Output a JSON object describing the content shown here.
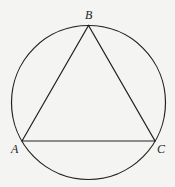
{
  "diagram": {
    "type": "inscribed-triangle",
    "circle": {
      "cx": 88.5,
      "cy": 102,
      "r": 77
    },
    "points": {
      "A": {
        "label": "A",
        "x": 22,
        "y": 141
      },
      "B": {
        "label": "B",
        "x": 88.5,
        "y": 25
      },
      "C": {
        "label": "C",
        "x": 155,
        "y": 141
      }
    },
    "segments": [
      [
        "A",
        "B"
      ],
      [
        "B",
        "C"
      ],
      [
        "C",
        "A"
      ]
    ],
    "colors": {
      "stroke": "#222222",
      "background": "#f4f4f2"
    }
  }
}
